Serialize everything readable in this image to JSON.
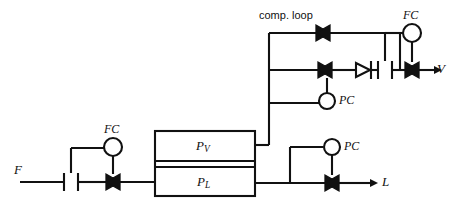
{
  "diagram": {
    "stroke_color": "#111111",
    "background_color": "#ffffff",
    "labels": {
      "comp_loop": "comp. loop",
      "feed": "F",
      "vapor_out": "V",
      "liquid_out": "L",
      "vessel_vapor": "P",
      "vessel_vapor_sub": "V",
      "vessel_liquid": "P",
      "vessel_liquid_sub": "L",
      "fc_feed": "FC",
      "fc_vapor": "FC",
      "pc_comp": "PC",
      "pc_liquid": "PC"
    },
    "instruments": [
      {
        "tag": "FC",
        "name": "fc-feed-controller",
        "cx": 113,
        "cy": 147,
        "r": 9
      },
      {
        "tag": "FC",
        "name": "fc-vapor-controller",
        "cx": 412,
        "cy": 33,
        "r": 9
      },
      {
        "tag": "PC",
        "name": "pc-compressor-controller",
        "cx": 327,
        "cy": 101,
        "r": 8
      },
      {
        "tag": "PC",
        "name": "pc-liquid-controller",
        "cx": 332,
        "cy": 147,
        "r": 8
      }
    ],
    "valves": [
      {
        "name": "feed-control-valve",
        "x": 113,
        "y": 182,
        "type": "control"
      },
      {
        "name": "comp-loop-bypass-valve",
        "x": 323,
        "y": 33,
        "type": "control"
      },
      {
        "name": "comp-loop-recycle-valve",
        "x": 325,
        "y": 70,
        "type": "control"
      },
      {
        "name": "vapor-control-valve",
        "x": 412,
        "y": 70,
        "type": "control"
      },
      {
        "name": "liquid-control-valve",
        "x": 332,
        "y": 183,
        "type": "control"
      }
    ],
    "check_valves": [
      {
        "name": "vapor-check-valve",
        "x": 363,
        "y": 70
      }
    ],
    "flow_elements": [
      {
        "name": "feed-orifice-meter",
        "x": 71,
        "y": 182
      },
      {
        "name": "vapor-orifice-meter",
        "x": 385,
        "y": 70
      }
    ],
    "vessel": {
      "name": "flash-drum",
      "x": 155,
      "y": 131,
      "width": 100,
      "height": 65,
      "split_y": 165
    }
  }
}
